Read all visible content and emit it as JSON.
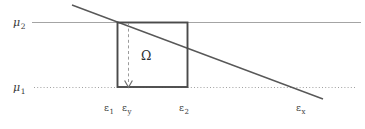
{
  "figure": {
    "width": 365,
    "height": 129,
    "background": "#ffffff",
    "line_color": "#8a8a8a",
    "stroke_color": "#4a4a4a",
    "text_color": "#3a3a3a"
  },
  "labels": {
    "mu2": {
      "base": "μ",
      "sub": "2",
      "x": 13,
      "y": 17
    },
    "mu1": {
      "base": "μ",
      "sub": "1",
      "x": 13,
      "y": 82
    },
    "omega": {
      "text": "Ω",
      "x": 141,
      "y": 50
    },
    "eps1": {
      "base": "ε",
      "sub": "1",
      "x": 104,
      "y": 103
    },
    "epsy": {
      "base": "ε",
      "sub": "y",
      "x": 122,
      "y": 103
    },
    "eps2": {
      "base": "ε",
      "sub": "2",
      "x": 179,
      "y": 103
    },
    "epsx": {
      "base": "ε",
      "sub": "x",
      "x": 296,
      "y": 103
    }
  },
  "geometry": {
    "mu2_line": {
      "x1": 32,
      "y1": 22.5,
      "x2": 361,
      "y2": 22.5,
      "style": "solid"
    },
    "mu1_line": {
      "x1": 34,
      "y1": 87.5,
      "x2": 356,
      "y2": 87.5,
      "style": "dotted"
    },
    "rect": {
      "x": 117,
      "y": 22,
      "width": 71,
      "height": 65
    },
    "dashed_drop": {
      "x": 128.5,
      "y1": 23,
      "y2": 84
    },
    "arrow_head": {
      "x": 128.5,
      "y": 87
    },
    "diagonal": {
      "x1": 72,
      "y1": 5,
      "x2": 323,
      "y2": 99
    }
  }
}
